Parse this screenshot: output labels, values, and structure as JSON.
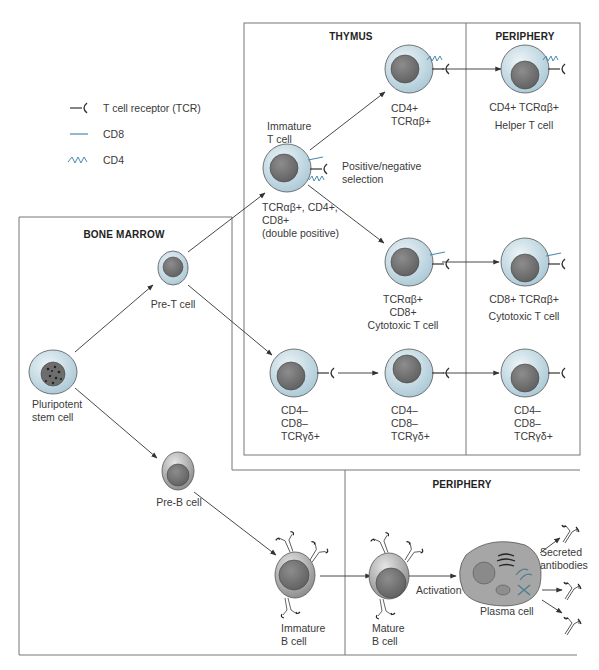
{
  "legend": {
    "items": [
      {
        "icon": "tcr-icon",
        "label": "T cell receptor (TCR)"
      },
      {
        "icon": "cd8-icon",
        "label": "CD8"
      },
      {
        "icon": "cd4-icon",
        "label": "CD4"
      }
    ]
  },
  "regions": {
    "thymus": "THYMUS",
    "periphery_top": "PERIPHERY",
    "bone_marrow": "BONE MARROW",
    "periphery_bottom": "PERIPHERY"
  },
  "cells": {
    "stem": "Pluripotent\nstem cell",
    "pre_t": "Pre-T cell",
    "pre_b": "Pre-B cell",
    "immature_t_title": "Immature\nT cell",
    "immature_t_markers": "TCRαβ+, CD4+,\nCD8+\n(double positive)",
    "selection": "Positive/negative\nselection",
    "thymus_cd4": "CD4+\nTCRαβ+",
    "thymus_cd8": "TCRαβ+\nCD8+\nCytotoxic T cell",
    "thymus_gd1": "CD4–\nCD8–\nTCRγδ+",
    "thymus_gd2": "CD4–\nCD8–\nTCRγδ+",
    "periph_helper_markers": "CD4+ TCRαβ+",
    "periph_helper_name": "Helper T cell",
    "periph_cyto_markers": "CD8+ TCRαβ+",
    "periph_cyto_name": "Cytotoxic T cell",
    "periph_gd": "CD4–\nCD8–\nTCRγδ+",
    "immature_b": "Immature\nB cell",
    "mature_b": "Mature\nB cell",
    "activation": "Activation",
    "plasma": "Plasma cell",
    "antibodies": "Secreted\nantibodies"
  },
  "colors": {
    "cell_cytoplasm": "#c9dde6",
    "cell_nucleus": "#7a7a7a",
    "b_cell": "#a9a9a9",
    "cd8_line": "#4a8cb0",
    "cd4_zigzag": "#4a8cb0",
    "border": "#777777"
  }
}
